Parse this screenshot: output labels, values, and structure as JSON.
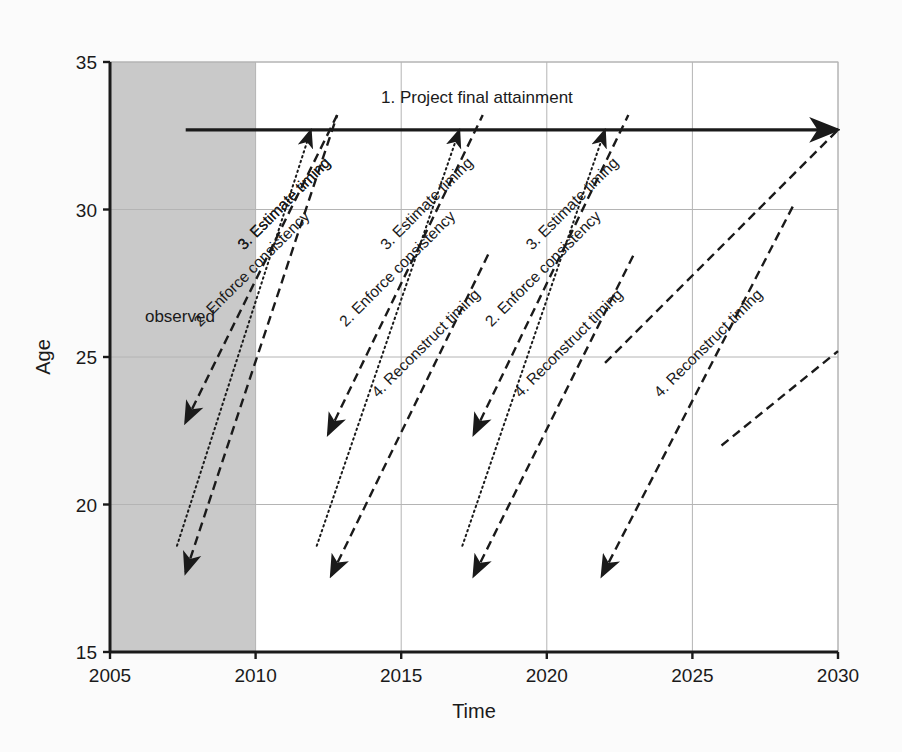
{
  "chart_data": {
    "type": "line",
    "title": "",
    "xlabel": "Time",
    "ylabel": "Age",
    "xlim": [
      2005,
      2030
    ],
    "ylim": [
      15,
      35
    ],
    "xticks": [
      2005,
      2010,
      2015,
      2020,
      2025,
      2030
    ],
    "yticks": [
      15,
      20,
      25,
      30,
      35
    ],
    "grid": true,
    "legend": "none",
    "colors": {
      "line": "#1a1a1a",
      "grid": "#b4b4b4",
      "observed_shading": "#c9c9c9",
      "background": "#ffffff",
      "page_background": "#fbfbfb"
    },
    "regions": [
      {
        "name": "observed",
        "label": "observed",
        "x_start": 2005,
        "x_end": 2010,
        "y_start": 15,
        "y_end": 35,
        "label_x": 2006.2,
        "label_y": 26.2
      }
    ],
    "annotations": [
      {
        "id": "step1",
        "label": "1. Project final attainment",
        "style": "solid",
        "arrow": "end",
        "x1": 2007.6,
        "y1": 32.7,
        "x2": 2030.0,
        "y2": 32.7,
        "label_x": 2017.6,
        "label_y": 33.6,
        "label_rotation": 0
      },
      {
        "id": "step2-a",
        "label": "2. Enforce consistency",
        "style": "dotted",
        "arrow": "end",
        "x1": 2007.3,
        "y1": 18.6,
        "x2": 2011.9,
        "y2": 32.7,
        "label_x": 2008.1,
        "label_y": 26.0,
        "label_rotation": -45
      },
      {
        "id": "step3-a",
        "label": "3. Estimate timing",
        "style": "dashed",
        "arrow": "start",
        "x1": 2007.6,
        "y1": 22.8,
        "x2": 2012.8,
        "y2": 33.2,
        "label_x": 2009.6,
        "label_y": 28.6,
        "label_rotation": -45
      },
      {
        "id": "step3-b",
        "label": "3. Estimate timing",
        "style": "dashed",
        "arrow": "start",
        "x1": 2007.6,
        "y1": 17.7,
        "x2": 2012.8,
        "y2": 33.2,
        "label_x": 2009.6,
        "label_y": 28.6,
        "label_rotation": -45
      },
      {
        "id": "step2-b",
        "label": "2. Enforce consistency",
        "style": "dotted",
        "arrow": "end",
        "x1": 2012.1,
        "y1": 18.6,
        "x2": 2017.0,
        "y2": 32.7,
        "label_x": 2013.1,
        "label_y": 26.0,
        "label_rotation": -45
      },
      {
        "id": "step3-c",
        "label": "3. Estimate timing",
        "style": "dashed",
        "arrow": "start",
        "x1": 2012.5,
        "y1": 22.4,
        "x2": 2017.8,
        "y2": 33.2,
        "label_x": 2014.5,
        "label_y": 28.6,
        "label_rotation": -45
      },
      {
        "id": "step2-c",
        "label": "2. Enforce consistency",
        "style": "dotted",
        "arrow": "end",
        "x1": 2017.1,
        "y1": 18.6,
        "x2": 2022.0,
        "y2": 32.7,
        "label_x": 2018.1,
        "label_y": 26.0,
        "label_rotation": -45
      },
      {
        "id": "step3-d",
        "label": "3. Estimate timing",
        "style": "dashed",
        "arrow": "start",
        "x1": 2017.5,
        "y1": 22.4,
        "x2": 2022.8,
        "y2": 33.2,
        "label_x": 2019.5,
        "label_y": 28.6,
        "label_rotation": -45
      },
      {
        "id": "step4-a",
        "label": "4. Reconstruct timing",
        "style": "dashed",
        "arrow": "start",
        "x1": 2012.6,
        "y1": 17.6,
        "x2": 2018.0,
        "y2": 28.5,
        "label_x": 2014.2,
        "label_y": 23.6,
        "label_rotation": -45
      },
      {
        "id": "step4-b",
        "label": "4. Reconstruct timing",
        "style": "dashed",
        "arrow": "start",
        "x1": 2017.5,
        "y1": 17.6,
        "x2": 2023.0,
        "y2": 28.5,
        "label_x": 2019.1,
        "label_y": 23.6,
        "label_rotation": -45
      },
      {
        "id": "step4-c",
        "label": "4. Reconstruct timing",
        "style": "dashed",
        "arrow": "start",
        "x1": 2021.9,
        "y1": 17.6,
        "x2": 2028.5,
        "y2": 30.2,
        "label_x": 2023.9,
        "label_y": 23.6,
        "label_rotation": -45
      },
      {
        "id": "tail-right-1",
        "label": "",
        "style": "dashed",
        "arrow": "none",
        "x1": 2022.0,
        "y1": 24.8,
        "x2": 2030.0,
        "y2": 32.7,
        "label_x": 0,
        "label_y": 0,
        "label_rotation": -45
      },
      {
        "id": "tail-right-2",
        "label": "",
        "style": "dashed",
        "arrow": "none",
        "x1": 2026.0,
        "y1": 22.0,
        "x2": 2030.0,
        "y2": 25.2,
        "label_x": 0,
        "label_y": 0,
        "label_rotation": -45
      }
    ]
  }
}
